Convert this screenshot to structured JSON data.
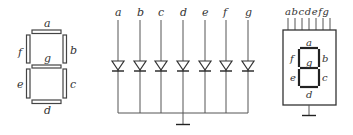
{
  "left_display": {
    "segments": [
      "a",
      "b",
      "c",
      "d",
      "e",
      "f",
      "g"
    ],
    "labels": {
      "a": "a",
      "b": "b",
      "c": "c",
      "d": "d",
      "e": "e",
      "f": "f",
      "g": "g"
    }
  },
  "diode_array": {
    "inputs": [
      {
        "label": "a",
        "x": 118
      },
      {
        "label": "b",
        "x": 140
      },
      {
        "label": "c",
        "x": 161
      },
      {
        "label": "d",
        "x": 183
      },
      {
        "label": "e",
        "x": 205
      },
      {
        "label": "f",
        "x": 226
      },
      {
        "label": "g",
        "x": 248
      }
    ],
    "common": "cathode-ground"
  },
  "package": {
    "pins": [
      "a",
      "b",
      "c",
      "d",
      "e",
      "f",
      "g"
    ],
    "pin_label_text": "abcdefg",
    "labels": {
      "a": "a",
      "b": "b",
      "c": "c",
      "d": "d",
      "e": "e",
      "f": "f",
      "g": "g"
    }
  }
}
